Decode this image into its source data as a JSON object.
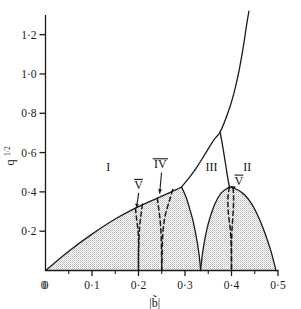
{
  "chart_data": {
    "type": "line",
    "title": "",
    "subtitle": "",
    "xlabel": "|b̃|",
    "ylabel": "q¹ᐟ²",
    "ylabel_base": "q",
    "ylabel_exponent": "1/2",
    "xlim": [
      0,
      0.5
    ],
    "ylim": [
      0,
      1.3
    ],
    "grid": false,
    "legend": null,
    "decimal_separator": "·",
    "xticks": [
      0,
      0.1,
      0.2,
      0.3,
      0.4,
      0.5
    ],
    "xtick_labels": [
      "0",
      "0·1",
      "0·2",
      "0·3",
      "0·4",
      "0·5"
    ],
    "xminor_ticks": [
      0.05,
      0.15,
      0.25,
      0.35,
      0.45
    ],
    "yticks": [
      0.2,
      0.4,
      0.6,
      0.8,
      1.0,
      1.2
    ],
    "ytick_labels": [
      "0·2",
      "0·4",
      "0·6",
      "0·8",
      "1·0",
      "1·2"
    ],
    "shaded_fill": "#d5d5d5",
    "line_color": "#1a1a1a",
    "region_labels": [
      {
        "text": "I",
        "x": 0.135,
        "y": 0.505
      },
      {
        "text": "IV",
        "x": 0.247,
        "y": 0.52,
        "overline": true
      },
      {
        "text": "V",
        "x": 0.2,
        "y": 0.415,
        "overline": true
      },
      {
        "text": "III",
        "x": 0.357,
        "y": 0.505
      },
      {
        "text": "II",
        "x": 0.434,
        "y": 0.505
      },
      {
        "text": "V",
        "x": 0.416,
        "y": 0.437,
        "overline": true
      }
    ],
    "series": [
      {
        "name": "lower-left-boundary-region-I",
        "style": "solid",
        "points": [
          [
            0,
            0
          ],
          [
            0.05,
            0.098
          ],
          [
            0.1,
            0.185
          ],
          [
            0.15,
            0.262
          ],
          [
            0.2,
            0.325
          ],
          [
            0.25,
            0.378
          ],
          [
            0.28,
            0.41
          ],
          [
            0.2925,
            0.425
          ]
        ]
      },
      {
        "name": "upper-branch-to-infinity",
        "style": "solid",
        "points": [
          [
            0.2925,
            0.425
          ],
          [
            0.31,
            0.475
          ],
          [
            0.328,
            0.535
          ],
          [
            0.345,
            0.6
          ],
          [
            0.362,
            0.665
          ],
          [
            0.3755,
            0.705
          ],
          [
            0.392,
            0.8
          ],
          [
            0.405,
            0.9
          ],
          [
            0.4165,
            1.02
          ],
          [
            0.4255,
            1.14
          ],
          [
            0.4325,
            1.25
          ],
          [
            0.4375,
            1.32
          ]
        ]
      },
      {
        "name": "region-I-right-descending-to-cusp",
        "style": "solid",
        "points": [
          [
            0.2925,
            0.425
          ],
          [
            0.302,
            0.375
          ],
          [
            0.31,
            0.315
          ],
          [
            0.3175,
            0.25
          ],
          [
            0.324,
            0.175
          ],
          [
            0.3295,
            0.095
          ],
          [
            0.3325,
            0.03
          ],
          [
            0.3335,
            0.0
          ]
        ]
      },
      {
        "name": "region-III-right-boundary",
        "style": "solid",
        "points": [
          [
            0.3755,
            0.705
          ],
          [
            0.3815,
            0.625
          ],
          [
            0.387,
            0.545
          ],
          [
            0.392,
            0.47
          ],
          [
            0.3955,
            0.425
          ]
        ]
      },
      {
        "name": "region-II-left-rise-from-cusp",
        "style": "solid",
        "points": [
          [
            0.3335,
            0.0
          ],
          [
            0.3375,
            0.085
          ],
          [
            0.3435,
            0.17
          ],
          [
            0.352,
            0.255
          ],
          [
            0.3645,
            0.34
          ],
          [
            0.378,
            0.395
          ],
          [
            0.3955,
            0.425
          ]
        ]
      },
      {
        "name": "region-II-right-descent",
        "style": "solid",
        "points": [
          [
            0.3955,
            0.425
          ],
          [
            0.412,
            0.412
          ],
          [
            0.428,
            0.385
          ],
          [
            0.443,
            0.34
          ],
          [
            0.4575,
            0.275
          ],
          [
            0.472,
            0.19
          ],
          [
            0.484,
            0.105
          ],
          [
            0.492,
            0.035
          ],
          [
            0.4955,
            0.0
          ]
        ]
      },
      {
        "name": "boundary-V-left-at-0p2",
        "style": "dashed",
        "points": [
          [
            0.1935,
            0.317
          ],
          [
            0.1955,
            0.27
          ],
          [
            0.1985,
            0.215
          ],
          [
            0.2,
            0.16
          ],
          [
            0.2,
            0.08
          ],
          [
            0.2,
            0.0
          ]
        ]
      },
      {
        "name": "boundary-V-right-at-0p2",
        "style": "dashed",
        "points": [
          [
            0.2085,
            0.337
          ],
          [
            0.2055,
            0.285
          ],
          [
            0.2025,
            0.225
          ],
          [
            0.201,
            0.16
          ],
          [
            0.2,
            0.08
          ],
          [
            0.2,
            0.0
          ]
        ]
      },
      {
        "name": "boundary-IV-left-at-0p25",
        "style": "dashed",
        "points": [
          [
            0.2405,
            0.368
          ],
          [
            0.2435,
            0.315
          ],
          [
            0.2465,
            0.255
          ],
          [
            0.2485,
            0.19
          ],
          [
            0.2495,
            0.1
          ],
          [
            0.25,
            0.0
          ]
        ]
      },
      {
        "name": "boundary-IV-right-at-0p25",
        "style": "dashed",
        "points": [
          [
            0.2735,
            0.412
          ],
          [
            0.2665,
            0.355
          ],
          [
            0.2585,
            0.29
          ],
          [
            0.2535,
            0.22
          ],
          [
            0.2512,
            0.13
          ],
          [
            0.25,
            0.0
          ]
        ]
      },
      {
        "name": "boundary-V-left-at-0p4",
        "style": "dashed",
        "points": [
          [
            0.3955,
            0.425
          ],
          [
            0.3925,
            0.375
          ],
          [
            0.3925,
            0.32
          ],
          [
            0.3945,
            0.265
          ],
          [
            0.3975,
            0.205
          ],
          [
            0.3995,
            0.12
          ],
          [
            0.4,
            0.0
          ]
        ]
      },
      {
        "name": "boundary-V-right-at-0p4",
        "style": "dashed",
        "points": [
          [
            0.4035,
            0.42
          ],
          [
            0.4045,
            0.37
          ],
          [
            0.404,
            0.315
          ],
          [
            0.4025,
            0.26
          ],
          [
            0.401,
            0.205
          ],
          [
            0.4,
            0.12
          ],
          [
            0.4,
            0.0
          ]
        ]
      }
    ],
    "leaders": [
      {
        "name": "leader-V-left",
        "from": [
          0.2005,
          0.395
        ],
        "to": [
          0.1955,
          0.318
        ]
      },
      {
        "name": "leader-IV",
        "from": [
          0.2495,
          0.498
        ],
        "to": [
          0.2455,
          0.392
        ]
      },
      {
        "name": "leader-V-right",
        "from": [
          0.4085,
          0.418
        ],
        "to": [
          0.3985,
          0.428
        ]
      }
    ]
  }
}
